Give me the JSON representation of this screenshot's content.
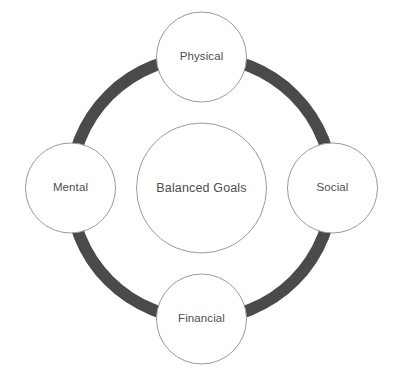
{
  "diagram": {
    "title": "Balanced Goals",
    "type": "hub-and-spoke-ring",
    "hub": {
      "label": "Balanced Goals",
      "cx": 201.5,
      "cy": 188,
      "r": 65,
      "fill": "#ffffff",
      "stroke": "#9a9a9a"
    },
    "ring": {
      "cx": 201.5,
      "cy": 188,
      "r": 131,
      "thickness": 12,
      "color": "#4a4a4a"
    },
    "nodes": [
      {
        "id": "physical",
        "label": "Physical",
        "position": "top",
        "cx": 201.5,
        "cy": 57,
        "r": 45,
        "fill": "#ffffff",
        "stroke": "#9a9a9a"
      },
      {
        "id": "social",
        "label": "Social",
        "position": "right",
        "cx": 332.5,
        "cy": 188,
        "r": 45,
        "fill": "#ffffff",
        "stroke": "#9a9a9a"
      },
      {
        "id": "financial",
        "label": "Financial",
        "position": "bottom",
        "cx": 201.5,
        "cy": 319,
        "r": 45,
        "fill": "#ffffff",
        "stroke": "#9a9a9a"
      },
      {
        "id": "mental",
        "label": "Mental",
        "position": "left",
        "cx": 70.5,
        "cy": 188,
        "r": 45,
        "fill": "#ffffff",
        "stroke": "#9a9a9a"
      }
    ],
    "caption": {
      "text": "",
      "visible": false
    },
    "colors": {
      "background": "#ffffff",
      "ring": "#4a4a4a",
      "circle_fill": "#ffffff",
      "circle_stroke": "#9a9a9a",
      "text": "#4e4e4e"
    }
  }
}
